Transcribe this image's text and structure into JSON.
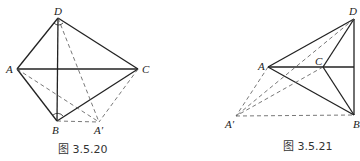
{
  "figures": [
    {
      "caption": "图 3.5.20",
      "points": {
        "D": {
          "label": "D",
          "x": 58,
          "y": 18
        },
        "A": {
          "label": "A",
          "x": 17,
          "y": 69
        },
        "C": {
          "label": "C",
          "x": 138,
          "y": 69
        },
        "B": {
          "label": "B",
          "x": 57,
          "y": 121
        },
        "Ap": {
          "label": "A′",
          "x": 99,
          "y": 122
        }
      },
      "solid_edges": [
        [
          "D",
          "A"
        ],
        [
          "D",
          "C"
        ],
        [
          "D",
          "B"
        ],
        [
          "A",
          "C"
        ],
        [
          "A",
          "B"
        ],
        [
          "B",
          "C"
        ]
      ],
      "dashed_edges": [
        [
          "D",
          "Ap"
        ],
        [
          "A",
          "Ap"
        ],
        [
          "B",
          "Ap"
        ],
        [
          "C",
          "Ap"
        ]
      ],
      "angle_marks": [
        "D",
        "B"
      ]
    },
    {
      "caption": "图 3.5.21",
      "points": {
        "D": {
          "label": "D",
          "x": 354,
          "y": 19
        },
        "A": {
          "label": "A",
          "x": 268,
          "y": 67
        },
        "C": {
          "label": "C",
          "x": 323,
          "y": 67
        },
        "B": {
          "label": "B",
          "x": 354,
          "y": 115
        },
        "Ap": {
          "label": "A′",
          "x": 236,
          "y": 116
        }
      },
      "solid_edges": [
        [
          "A",
          "D"
        ],
        [
          "A",
          "B"
        ],
        [
          "A",
          "M"
        ],
        [
          "C",
          "D"
        ],
        [
          "C",
          "B"
        ],
        [
          "D",
          "B"
        ]
      ],
      "dashed_edges": [
        [
          "A",
          "Ap"
        ],
        [
          "D",
          "Ap"
        ],
        [
          "C",
          "Ap"
        ],
        [
          "Ap",
          "B"
        ]
      ]
    }
  ]
}
